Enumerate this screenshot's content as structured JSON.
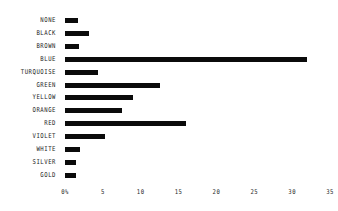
{
  "chart_data": {
    "type": "bar",
    "orientation": "horizontal",
    "title": "",
    "subtitle": "",
    "xlabel": "",
    "ylabel": "",
    "xlim": [
      0,
      35
    ],
    "ylim": null,
    "grid": false,
    "legend": null,
    "legend_position": "none",
    "bar_color": "#0b0b0b",
    "background_color": "#ffffff",
    "categories": [
      "NONE",
      "BLACK",
      "BROWN",
      "BLUE",
      "TURQUOISE",
      "GREEN",
      "YELLOW",
      "ORANGE",
      "RED",
      "VIOLET",
      "WHITE",
      "SILVER",
      "GOLD"
    ],
    "values": [
      1.7,
      3.2,
      1.8,
      32,
      4.3,
      12.5,
      9,
      7.5,
      16,
      5.3,
      2,
      1.5,
      1.5
    ],
    "xticks": [
      0,
      5,
      10,
      15,
      20,
      25,
      30,
      35
    ],
    "xtick_labels": [
      "0%",
      "5",
      "10",
      "15",
      "20",
      "25",
      "30",
      "35"
    ],
    "bars": [
      {
        "label": "NONE",
        "value": 1.7
      },
      {
        "label": "BLACK",
        "value": 3.2
      },
      {
        "label": "BROWN",
        "value": 1.8
      },
      {
        "label": "BLUE",
        "value": 32
      },
      {
        "label": "TURQUOISE",
        "value": 4.3
      },
      {
        "label": "GREEN",
        "value": 12.5
      },
      {
        "label": "YELLOW",
        "value": 9
      },
      {
        "label": "ORANGE",
        "value": 7.5
      },
      {
        "label": "RED",
        "value": 16
      },
      {
        "label": "VIOLET",
        "value": 5.3
      },
      {
        "label": "WHITE",
        "value": 2
      },
      {
        "label": "SILVER",
        "value": 1.5
      },
      {
        "label": "GOLD",
        "value": 1.5
      }
    ]
  }
}
